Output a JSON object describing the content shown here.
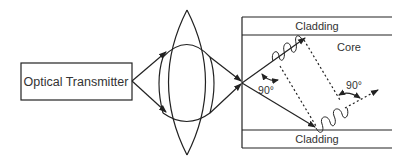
{
  "diagram": {
    "transmitter_label": "Optical Transmitter",
    "top_cladding_label": "Cladding",
    "bottom_cladding_label": "Cladding",
    "core_label": "Core",
    "angle_label_left": "90°",
    "angle_label_right": "90°",
    "colors": {
      "stroke": "#222222",
      "text": "#333333",
      "background": "#ffffff"
    }
  }
}
